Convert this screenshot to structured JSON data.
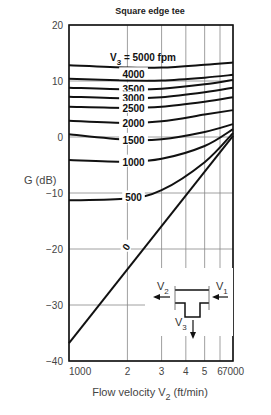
{
  "chart_data": {
    "type": "line",
    "title": "Square edge tee",
    "xlabel": "Flow velocity V2 (ft/min)",
    "ylabel": "G (dB)",
    "xscale": "log",
    "xlim": [
      1000,
      7000
    ],
    "ylim": [
      -40,
      20
    ],
    "x_ticks": [
      {
        "v": 1000,
        "label": "1000"
      },
      {
        "v": 2000,
        "label": "2"
      },
      {
        "v": 3000,
        "label": "3"
      },
      {
        "v": 4000,
        "label": "4"
      },
      {
        "v": 5000,
        "label": "5"
      },
      {
        "v": 6000,
        "label": "6"
      },
      {
        "v": 7000,
        "label": "7000"
      }
    ],
    "y_ticks": [
      20,
      10,
      0,
      -10,
      -20,
      -30,
      -40
    ],
    "grid": true,
    "legend_title": "V3 = 5000 fpm",
    "series": [
      {
        "name": "5000",
        "x": [
          1000,
          2000,
          3000,
          5000,
          7000
        ],
        "values": [
          12.8,
          12.4,
          12.4,
          12.9,
          13.3
        ]
      },
      {
        "name": "4000",
        "x": [
          1000,
          2000,
          3000,
          5000,
          7000
        ],
        "values": [
          10.4,
          10.1,
          10.1,
          10.6,
          11.1
        ]
      },
      {
        "name": "3500",
        "x": [
          1000,
          2000,
          3000,
          5000,
          7000
        ],
        "values": [
          8.8,
          8.5,
          8.6,
          9.4,
          10.2
        ]
      },
      {
        "name": "3000",
        "x": [
          1000,
          2000,
          3000,
          5000,
          7000
        ],
        "values": [
          7.2,
          6.9,
          7.1,
          8.0,
          8.8
        ]
      },
      {
        "name": "2500",
        "x": [
          1000,
          2000,
          3000,
          5000,
          7000
        ],
        "values": [
          5.4,
          5.2,
          5.4,
          6.3,
          7.1
        ]
      },
      {
        "name": "2000",
        "x": [
          1000,
          2000,
          3000,
          5000,
          7000
        ],
        "values": [
          2.9,
          2.5,
          2.8,
          4.0,
          4.8
        ]
      },
      {
        "name": "1500",
        "x": [
          1000,
          2000,
          3000,
          5000,
          7000
        ],
        "values": [
          0.5,
          -0.5,
          -0.4,
          0.9,
          2.3
        ]
      },
      {
        "name": "1000",
        "x": [
          1000,
          2000,
          3000,
          5000,
          7000
        ],
        "values": [
          -4.1,
          -4.4,
          -3.9,
          -1.6,
          1.4
        ]
      },
      {
        "name": "500",
        "x": [
          1000,
          2000,
          3000,
          5000,
          7000
        ],
        "values": [
          -11.3,
          -11.0,
          -9.5,
          -4.5,
          0.7
        ]
      },
      {
        "name": "0",
        "x": [
          1000,
          7000
        ],
        "values": [
          -36.8,
          0.2
        ]
      }
    ],
    "curve_labels": [
      {
        "text": "4000",
        "x": 2150,
        "y": 11.2
      },
      {
        "text": "3500",
        "x": 2150,
        "y": 8.5
      },
      {
        "text": "3000",
        "x": 2150,
        "y": 6.9
      },
      {
        "text": "2500",
        "x": 2150,
        "y": 5.2
      },
      {
        "text": "2000",
        "x": 2150,
        "y": 2.5
      },
      {
        "text": "1500",
        "x": 2150,
        "y": -0.5
      },
      {
        "text": "1000",
        "x": 2150,
        "y": -4.4
      },
      {
        "text": "500",
        "x": 2150,
        "y": -10.8
      },
      {
        "text": "0",
        "x": 1960,
        "y": -19.6
      }
    ],
    "inset_diagram": {
      "labels": [
        "V2",
        "V1",
        "V3"
      ]
    }
  }
}
